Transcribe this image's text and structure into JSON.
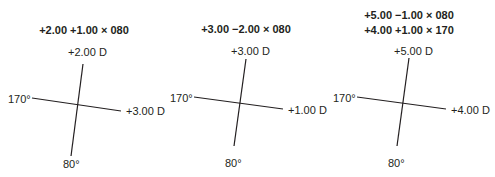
{
  "panels": [
    {
      "prescription": [
        "+2.00 +1.00 × 080"
      ],
      "top_power": "+2.00 D",
      "right_power": "+3.00 D",
      "left_axis": "170°",
      "bottom_axis": "80°"
    },
    {
      "prescription": [
        "+3.00 −2.00 × 080"
      ],
      "top_power": "+3.00 D",
      "right_power": "+1.00 D",
      "left_axis": "170°",
      "bottom_axis": "80°"
    },
    {
      "prescription": [
        "+5.00 −1.00 × 080",
        "+4.00 +1.00 × 170"
      ],
      "top_power": "+5.00 D",
      "right_power": "+4.00 D",
      "left_axis": "170°",
      "bottom_axis": "80°"
    }
  ],
  "colors": {
    "line": "#231f20",
    "text": "#231f20",
    "background": "#ffffff"
  }
}
